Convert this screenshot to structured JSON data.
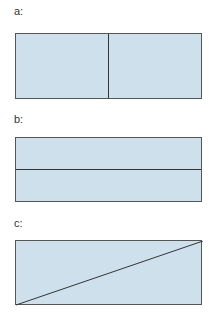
{
  "panels": [
    {
      "label": "a:",
      "division": "vertical line splitting rectangle into left and right halves"
    },
    {
      "label": "b:",
      "division": "horizontal line splitting rectangle into top and bottom halves"
    },
    {
      "label": "c:",
      "division": "diagonal line from bottom-left to top-right corner"
    }
  ],
  "colors": {
    "fill": "#cfe0ed",
    "stroke": "#333333"
  }
}
